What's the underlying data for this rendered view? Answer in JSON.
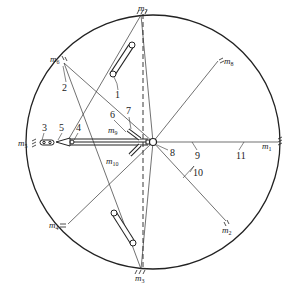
{
  "diagram": {
    "center": {
      "x": 153,
      "y": 142
    },
    "radius": 127,
    "stroke_color": "#222222",
    "masses": [
      {
        "id": "m1",
        "label": "m",
        "sub": "1",
        "x": 280,
        "y": 142,
        "lx": 262,
        "ly": 149
      },
      {
        "id": "m2",
        "label": "m",
        "sub": "2",
        "x": 226,
        "y": 221,
        "lx": 222,
        "ly": 233
      },
      {
        "id": "m3",
        "label": "m",
        "sub": "3",
        "x": 141,
        "y": 269,
        "lx": 135,
        "ly": 281
      },
      {
        "id": "m4",
        "label": "m",
        "sub": "4",
        "x": 68,
        "y": 224,
        "lx": 49,
        "ly": 228
      },
      {
        "id": "m5",
        "label": "m",
        "sub": "5",
        "x": 36,
        "y": 142,
        "lx": 17,
        "ly": 146
      },
      {
        "id": "m6",
        "label": "m",
        "sub": "6",
        "x": 64,
        "y": 63,
        "lx": 50,
        "ly": 62
      },
      {
        "id": "m7",
        "label": "m",
        "sub": "7",
        "x": 141,
        "y": 15,
        "lx": 138,
        "ly": 11
      },
      {
        "id": "m8",
        "label": "m",
        "sub": "8",
        "x": 218,
        "y": 61,
        "lx": 224,
        "ly": 64
      },
      {
        "id": "m9",
        "label": "m",
        "sub": "9",
        "x": 128,
        "y": 130,
        "lx": 108,
        "ly": 133
      },
      {
        "id": "m10",
        "label": "m",
        "sub": "10",
        "x": 130,
        "y": 155,
        "lx": 108,
        "ly": 164
      }
    ],
    "part_labels": [
      {
        "text": "1",
        "x": 118,
        "y": 98
      },
      {
        "text": "2",
        "x": 64,
        "y": 91
      },
      {
        "text": "3",
        "x": 43,
        "y": 130
      },
      {
        "text": "4",
        "x": 77,
        "y": 130
      },
      {
        "text": "5",
        "x": 61,
        "y": 130
      },
      {
        "text": "6",
        "x": 111,
        "y": 117
      },
      {
        "text": "7",
        "x": 127,
        "y": 114
      },
      {
        "text": "8",
        "x": 171,
        "y": 155
      },
      {
        "text": "9",
        "x": 197,
        "y": 158
      },
      {
        "text": "10",
        "x": 193,
        "y": 176
      },
      {
        "text": "11",
        "x": 236,
        "y": 158
      }
    ]
  }
}
